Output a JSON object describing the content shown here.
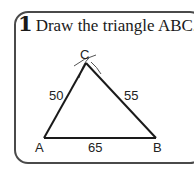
{
  "exercise": {
    "number": "1",
    "instruction": "Draw the triangle ABC."
  },
  "triangle": {
    "vertices": {
      "A": "A",
      "B": "B",
      "C": "C"
    },
    "sides": {
      "AC": "50",
      "BC": "55",
      "AB": "65"
    }
  },
  "colors": {
    "line": "#1a1a1a",
    "border": "#4a4a4a",
    "arc": "#555555"
  }
}
